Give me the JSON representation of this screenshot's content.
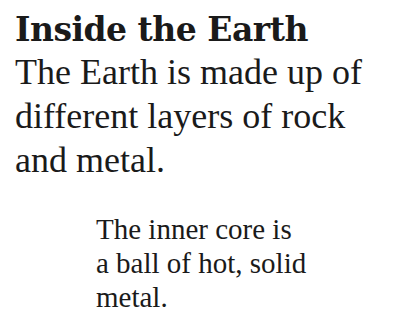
{
  "page": {
    "title": "Inside the Earth",
    "intro_lines": [
      "The Earth is made up of",
      "different layers of rock",
      "and metal."
    ],
    "caption_lines": [
      "The inner core is",
      "a ball of hot, solid",
      "metal."
    ]
  }
}
